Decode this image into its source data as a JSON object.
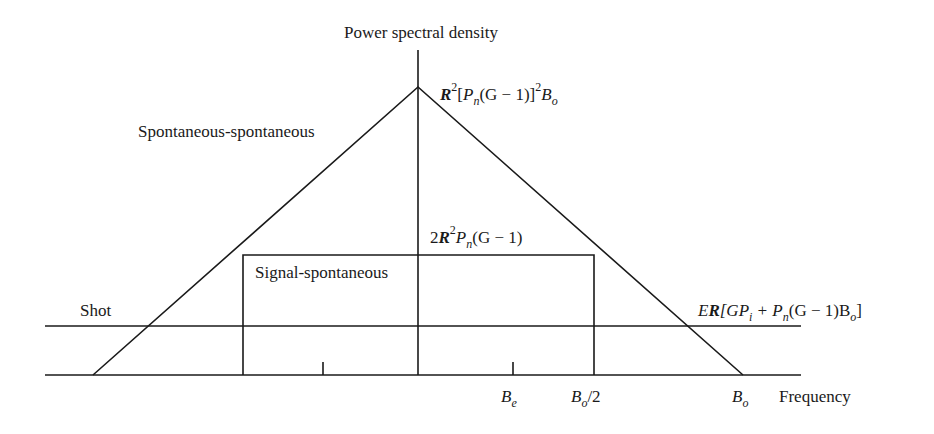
{
  "diagram": {
    "y_axis_label": "Power spectral density",
    "x_axis_label": "Frequency",
    "curves": {
      "spont_spont": {
        "label": "Spontaneous-spontaneous",
        "peak": {
          "R": "R",
          "sup1": "2",
          "open": "[",
          "P": "P",
          "n": "n",
          "mid": "(G − 1)]",
          "sup2": "2",
          "B": "B",
          "o": "o"
        }
      },
      "signal_spont": {
        "label": "Signal-spontaneous",
        "level": {
          "two": "2",
          "R": "R",
          "sup": "2",
          "P": "P",
          "n": "n",
          "rest": "(G − 1)"
        }
      },
      "shot": {
        "label": "Shot",
        "level": {
          "E": "E",
          "R": "R",
          "open": "[GP",
          "i": "i",
          "plus": " + P",
          "n": "n",
          "mid": "(G − 1)B",
          "o": "o",
          "close": "]"
        }
      }
    },
    "ticks": {
      "be": {
        "B": "B",
        "sub": "e"
      },
      "bo2": {
        "B": "B",
        "sub": "o",
        "rest": "/2"
      },
      "bo": {
        "B": "B",
        "sub": "o"
      }
    },
    "colors": {
      "line": "#1a1a1a",
      "background": "#ffffff"
    }
  }
}
